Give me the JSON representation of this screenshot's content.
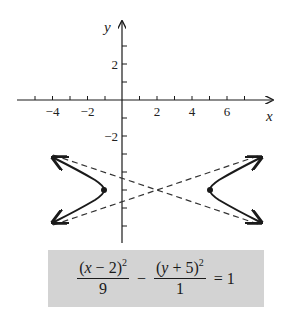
{
  "graph": {
    "x_axis_label": "x",
    "y_axis_label": "y",
    "x_tick_labels": [
      {
        "value": -4,
        "label": "−4"
      },
      {
        "value": -2,
        "label": "−2"
      },
      {
        "value": 2,
        "label": "2"
      },
      {
        "value": 4,
        "label": "4"
      },
      {
        "value": 6,
        "label": "6"
      }
    ],
    "y_tick_labels": [
      {
        "value": 2,
        "label": "2"
      },
      {
        "value": -2,
        "label": "−2"
      }
    ],
    "x_range": [
      -5,
      7
    ],
    "y_range": [
      -8,
      4
    ],
    "curve": "hyperbola",
    "center": [
      2,
      -5
    ],
    "vertices": [
      [
        -1,
        -5
      ],
      [
        5,
        -5
      ]
    ],
    "asymptotes": [
      "y + 5 = (1/3)(x - 2)",
      "y + 5 = -(1/3)(x - 2)"
    ],
    "colors": {
      "curve": "#1a1a1a",
      "asymptote": "#333333",
      "equation_box": "#d3d3d3"
    }
  },
  "equation": {
    "term1_numerator_open": "(",
    "term1_numerator_var": "x",
    "term1_numerator_rest": " − 2)",
    "term1_exponent": "2",
    "term1_denominator": "9",
    "operator": "−",
    "term2_numerator_open": "(",
    "term2_numerator_var": "y",
    "term2_numerator_rest": " + 5)",
    "term2_exponent": "2",
    "term2_denominator": "1",
    "rhs": "= 1"
  }
}
